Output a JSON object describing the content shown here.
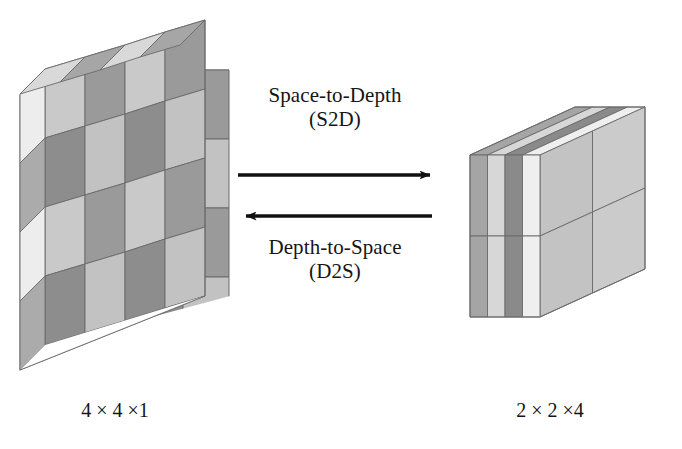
{
  "figure": {
    "background_color": "#ffffff",
    "line_color": "#5a5a5a",
    "arrow_color": "#111111",
    "text_color": "#151515"
  },
  "operations": [
    {
      "id": "s2d",
      "line1": "Space-to-Depth",
      "line2": "(S2D)",
      "arrow_direction": "right",
      "arrow_name": "arrow-right-s2d"
    },
    {
      "id": "d2s",
      "line1": "Depth-to-Space",
      "line2": "(D2S)",
      "arrow_direction": "left",
      "arrow_name": "arrow-left-d2s"
    }
  ],
  "tensors": {
    "left": {
      "label": "4 × 4 ×1",
      "name": "input-tensor-4x4x1",
      "rows": 4,
      "cols": 4,
      "depth": 1,
      "front_face_pattern": [
        [
          "light",
          "dark",
          "light",
          "dark"
        ],
        [
          "dark",
          "light",
          "dark",
          "light"
        ],
        [
          "light",
          "dark",
          "light",
          "dark"
        ],
        [
          "dark",
          "light",
          "dark",
          "light"
        ]
      ],
      "side_face_pattern": [
        "pale",
        "mid",
        "pale",
        "mid"
      ],
      "top_face_pattern": [
        "pale",
        "mid",
        "pale",
        "mid"
      ]
    },
    "right": {
      "label": "2 × 2 ×4",
      "name": "output-tensor-2x2x4",
      "rows": 2,
      "cols": 2,
      "depth": 4,
      "front_slab_pattern": [
        [
          "mid",
          "pale",
          "dark",
          "bright"
        ],
        [
          "mid",
          "pale",
          "dark",
          "bright"
        ]
      ],
      "side_face_pattern": [
        [
          "light",
          "light"
        ],
        [
          "light",
          "light"
        ]
      ],
      "top_slab_pattern": [
        "mid",
        "pale",
        "dark",
        "bright"
      ]
    }
  },
  "palette": {
    "bright": "#efefef",
    "pale": "#d8d8d8",
    "light": "#c4c4c4",
    "mid": "#a8a8a8",
    "dark": "#8b8b8b",
    "darker": "#7a7a7a",
    "edge": "#6a6a6a"
  }
}
